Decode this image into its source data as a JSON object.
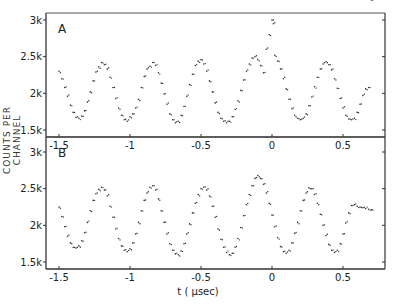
{
  "chart_data": [
    {
      "panel": "A",
      "type": "scatter",
      "title": "A",
      "xlabel": "t (μsec)",
      "ylabel": "COUNTS PER CHANNEL",
      "xlim": [
        -1.59,
        0.8
      ],
      "ylim": [
        1400,
        3100
      ],
      "xticks": [
        -1.5,
        -1,
        -0.5,
        0,
        0.5
      ],
      "xtick_labels": [
        "-1.5",
        "-1",
        "-0.5",
        "0",
        "0.5"
      ],
      "yticks": [
        1500,
        2000,
        2500,
        3000
      ],
      "ytick_labels": [
        "1.5k",
        "2k",
        "2.5k",
        "3k"
      ],
      "grid": false,
      "x": [
        -1.5,
        -1.48,
        -1.46,
        -1.44,
        -1.42,
        -1.4,
        -1.38,
        -1.36,
        -1.34,
        -1.32,
        -1.3,
        -1.28,
        -1.26,
        -1.24,
        -1.22,
        -1.2,
        -1.18,
        -1.16,
        -1.14,
        -1.12,
        -1.1,
        -1.08,
        -1.06,
        -1.04,
        -1.02,
        -1.0,
        -0.98,
        -0.96,
        -0.94,
        -0.92,
        -0.9,
        -0.88,
        -0.86,
        -0.84,
        -0.82,
        -0.8,
        -0.78,
        -0.76,
        -0.74,
        -0.72,
        -0.7,
        -0.68,
        -0.66,
        -0.64,
        -0.62,
        -0.6,
        -0.58,
        -0.56,
        -0.54,
        -0.52,
        -0.5,
        -0.48,
        -0.46,
        -0.44,
        -0.42,
        -0.4,
        -0.38,
        -0.36,
        -0.34,
        -0.32,
        -0.3,
        -0.28,
        -0.26,
        -0.24,
        -0.22,
        -0.2,
        -0.18,
        -0.16,
        -0.14,
        -0.12,
        -0.1,
        -0.08,
        -0.06,
        -0.04,
        -0.02,
        0.0,
        0.01,
        0.02,
        0.04,
        0.06,
        0.08,
        0.1,
        0.12,
        0.14,
        0.16,
        0.18,
        0.2,
        0.22,
        0.24,
        0.26,
        0.28,
        0.3,
        0.32,
        0.34,
        0.36,
        0.38,
        0.4,
        0.42,
        0.44,
        0.46,
        0.48,
        0.5,
        0.52,
        0.54,
        0.56,
        0.58,
        0.6,
        0.62,
        0.64,
        0.66,
        0.68,
        0.7
      ],
      "y": [
        2300,
        2200,
        2080,
        1960,
        1840,
        1740,
        1670,
        1660,
        1690,
        1760,
        1880,
        2020,
        2170,
        2290,
        2360,
        2420,
        2390,
        2330,
        2220,
        2080,
        1930,
        1800,
        1700,
        1640,
        1620,
        1680,
        1720,
        1800,
        1920,
        2080,
        2230,
        2330,
        2370,
        2420,
        2380,
        2280,
        2140,
        1990,
        1850,
        1720,
        1640,
        1600,
        1620,
        1700,
        1820,
        1960,
        2120,
        2260,
        2380,
        2440,
        2460,
        2400,
        2300,
        2170,
        2020,
        1870,
        1740,
        1660,
        1620,
        1600,
        1620,
        1680,
        1780,
        1900,
        2040,
        2180,
        2300,
        2400,
        2480,
        2500,
        2460,
        2380,
        2280,
        2600,
        2800,
        3000,
        2950,
        2520,
        2440,
        2330,
        2200,
        2060,
        1920,
        1790,
        1700,
        1660,
        1640,
        1660,
        1720,
        1830,
        1950,
        2090,
        2220,
        2330,
        2400,
        2430,
        2390,
        2320,
        2200,
        2070,
        1930,
        1800,
        1700,
        1650,
        1640,
        1660,
        1740,
        1850,
        1970,
        2060,
        2080
      ],
      "dot_color": "#333333"
    },
    {
      "panel": "B",
      "type": "scatter",
      "title": "B",
      "xlabel": "t (μsec)",
      "ylabel": "COUNTS PER CHANNEL",
      "xlim": [
        -1.59,
        0.8
      ],
      "ylim": [
        1400,
        3100
      ],
      "xticks": [
        -1.5,
        -1,
        -0.5,
        0,
        0.5
      ],
      "xtick_labels": [
        "-1.5",
        "-1",
        "-0.5",
        "0",
        "0.5"
      ],
      "yticks": [
        1500,
        2000,
        2500,
        3000
      ],
      "ytick_labels": [
        "1.5k",
        "2k",
        "2.5k",
        "3k"
      ],
      "grid": false,
      "x": [
        -1.5,
        -1.48,
        -1.46,
        -1.44,
        -1.42,
        -1.4,
        -1.38,
        -1.36,
        -1.34,
        -1.32,
        -1.3,
        -1.28,
        -1.26,
        -1.24,
        -1.22,
        -1.2,
        -1.18,
        -1.16,
        -1.14,
        -1.12,
        -1.1,
        -1.08,
        -1.06,
        -1.04,
        -1.02,
        -1.0,
        -0.98,
        -0.96,
        -0.94,
        -0.92,
        -0.9,
        -0.88,
        -0.86,
        -0.84,
        -0.82,
        -0.8,
        -0.78,
        -0.76,
        -0.74,
        -0.72,
        -0.7,
        -0.68,
        -0.66,
        -0.64,
        -0.62,
        -0.6,
        -0.58,
        -0.56,
        -0.54,
        -0.52,
        -0.5,
        -0.48,
        -0.46,
        -0.44,
        -0.42,
        -0.4,
        -0.38,
        -0.36,
        -0.34,
        -0.32,
        -0.3,
        -0.28,
        -0.26,
        -0.24,
        -0.22,
        -0.2,
        -0.18,
        -0.16,
        -0.14,
        -0.12,
        -0.1,
        -0.08,
        -0.06,
        -0.04,
        -0.02,
        0.0,
        0.02,
        0.04,
        0.06,
        0.08,
        0.1,
        0.12,
        0.14,
        0.16,
        0.18,
        0.2,
        0.22,
        0.24,
        0.26,
        0.28,
        0.3,
        0.32,
        0.34,
        0.36,
        0.38,
        0.4,
        0.42,
        0.44,
        0.46,
        0.48,
        0.5,
        0.52,
        0.54,
        0.56,
        0.58,
        0.6,
        0.62,
        0.64,
        0.66,
        0.68,
        0.7
      ],
      "y": [
        2250,
        2120,
        1980,
        1850,
        1760,
        1700,
        1690,
        1720,
        1790,
        1900,
        2040,
        2200,
        2340,
        2430,
        2490,
        2520,
        2480,
        2400,
        2260,
        2110,
        1950,
        1820,
        1720,
        1660,
        1640,
        1680,
        1760,
        1880,
        2040,
        2200,
        2340,
        2440,
        2520,
        2540,
        2480,
        2360,
        2200,
        2040,
        1880,
        1750,
        1660,
        1610,
        1600,
        1650,
        1750,
        1880,
        2020,
        2170,
        2300,
        2420,
        2500,
        2520,
        2480,
        2400,
        2260,
        2110,
        1950,
        1810,
        1700,
        1630,
        1600,
        1620,
        1700,
        1820,
        1970,
        2130,
        2280,
        2420,
        2540,
        2640,
        2680,
        2640,
        2560,
        2440,
        2300,
        2140,
        1980,
        1830,
        1710,
        1640,
        1620,
        1660,
        1760,
        1890,
        2040,
        2200,
        2340,
        2440,
        2510,
        2500,
        2420,
        2300,
        2150,
        2000,
        1860,
        1740,
        1660,
        1630,
        1660,
        1750,
        1880,
        2030,
        2170,
        2270,
        2280,
        2260,
        2250,
        2240,
        2230,
        2220,
        2210
      ],
      "dot_color": "#333333"
    }
  ],
  "panels": {
    "a_label": "A",
    "b_label": "B"
  },
  "axes": {
    "ylabel": "COUNTS PER CHANNEL",
    "xlabel": "t ( μsec)"
  }
}
